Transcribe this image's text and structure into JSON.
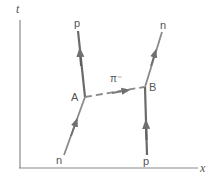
{
  "diagram": {
    "type": "feynman-spacetime-diagram",
    "axes": {
      "vertical_label": "t",
      "horizontal_label": "x"
    },
    "vertices": [
      {
        "id": "A",
        "label": "A"
      },
      {
        "id": "B",
        "label": "B"
      }
    ],
    "particles": {
      "incoming_left": "n",
      "outgoing_left": "p",
      "incoming_right": "p",
      "outgoing_right": "n",
      "exchanged": "π⁻"
    },
    "colors": {
      "line": "#7a7a7a",
      "axis": "#8a8a8a",
      "text": "#555555",
      "background": "#ffffff"
    }
  }
}
